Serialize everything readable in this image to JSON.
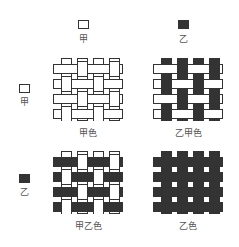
{
  "colors": {
    "jia": "#ffffff",
    "yi": "#333333",
    "stroke": "#333333"
  },
  "columns": [
    {
      "swatch_color": "#ffffff",
      "label": "甲"
    },
    {
      "swatch_color": "#333333",
      "label": "乙"
    }
  ],
  "rows": [
    {
      "swatch_color": "#ffffff",
      "label": "甲"
    },
    {
      "swatch_color": "#333333",
      "label": "乙"
    }
  ],
  "cells": [
    {
      "label": "甲色",
      "warp": "#ffffff",
      "weft": "#ffffff"
    },
    {
      "label": "乙甲色",
      "warp": "#333333",
      "weft": "#ffffff"
    },
    {
      "label": "甲乙色",
      "warp": "#ffffff",
      "weft": "#333333"
    },
    {
      "label": "乙色",
      "warp": "#333333",
      "weft": "#333333"
    }
  ]
}
